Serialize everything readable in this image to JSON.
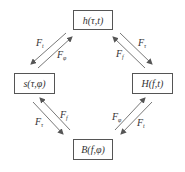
{
  "diagram": {
    "nodes": {
      "top": {
        "label": "h(τ,t)"
      },
      "left": {
        "label": "s(τ,φ)"
      },
      "right": {
        "label": "H(f,t)"
      },
      "bottom": {
        "label": "B(f,φ)"
      }
    },
    "edges": {
      "top_left_outer": {
        "base": "F",
        "sub": "t",
        "from": "top",
        "to": "left"
      },
      "top_left_inner": {
        "base": "F",
        "sub": "φ",
        "from": "left",
        "to": "top"
      },
      "top_right_outer": {
        "base": "F",
        "sub": "τ",
        "from": "top",
        "to": "right"
      },
      "top_right_inner": {
        "base": "F",
        "sub": "f",
        "from": "right",
        "to": "top"
      },
      "bottom_left_outer": {
        "base": "F",
        "sub": "τ",
        "from": "left",
        "to": "bottom"
      },
      "bottom_left_inner": {
        "base": "F",
        "sub": "f",
        "from": "bottom",
        "to": "left"
      },
      "bottom_right_inner": {
        "base": "F",
        "sub": "φ",
        "from": "bottom",
        "to": "right"
      },
      "bottom_right_outer": {
        "base": "F",
        "sub": "t",
        "from": "right",
        "to": "bottom"
      }
    },
    "colors": {
      "line": "#555555",
      "text": "#333333",
      "background": "#ffffff"
    }
  }
}
